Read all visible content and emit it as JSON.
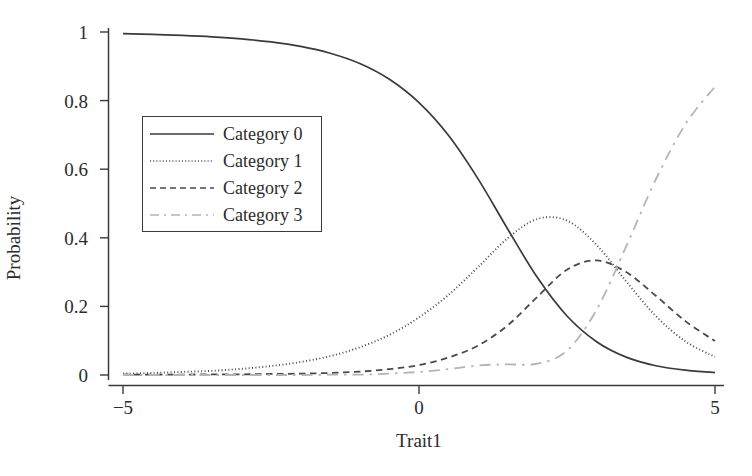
{
  "chart_data": {
    "type": "line",
    "title": "",
    "xlabel": "Trait1",
    "ylabel": "Probability",
    "xlim": [
      -5,
      5
    ],
    "ylim": [
      0,
      1
    ],
    "xticks": [
      "-5",
      "0",
      "5"
    ],
    "xtick_values": [
      -5,
      0,
      5
    ],
    "yticks": [
      "0",
      "0.2",
      "0.4",
      "0.6",
      "0.8",
      "1"
    ],
    "ytick_values": [
      0,
      0.2,
      0.4,
      0.6,
      0.8,
      1
    ],
    "grid": false,
    "legend_position": "upper left",
    "x": [
      -5,
      -4.5,
      -4,
      -3.5,
      -3,
      -2.5,
      -2,
      -1.5,
      -1,
      -0.5,
      0,
      0.5,
      1,
      1.5,
      2,
      2.5,
      3,
      3.5,
      4,
      4.5,
      5
    ],
    "series": [
      {
        "name": "Category 0",
        "style": "solid",
        "color": "#3a3a3a",
        "values": [
          0.995,
          0.993,
          0.99,
          0.986,
          0.98,
          0.971,
          0.958,
          0.938,
          0.908,
          0.862,
          0.794,
          0.698,
          0.571,
          0.425,
          0.284,
          0.172,
          0.097,
          0.052,
          0.027,
          0.014,
          0.007
        ]
      },
      {
        "name": "Category 1",
        "style": "dotted",
        "color": "#4a4a4a",
        "values": [
          0.004,
          0.006,
          0.009,
          0.012,
          0.018,
          0.026,
          0.038,
          0.055,
          0.081,
          0.117,
          0.168,
          0.234,
          0.315,
          0.399,
          0.455,
          0.45,
          0.379,
          0.273,
          0.172,
          0.098,
          0.053
        ]
      },
      {
        "name": "Category 2",
        "style": "dashed",
        "color": "#4a4a4a",
        "values": [
          0.001,
          0.001,
          0.001,
          0.002,
          0.002,
          0.003,
          0.004,
          0.006,
          0.01,
          0.017,
          0.029,
          0.051,
          0.086,
          0.145,
          0.228,
          0.307,
          0.334,
          0.3,
          0.231,
          0.157,
          0.099
        ]
      },
      {
        "name": "Category 3",
        "style": "dashdot",
        "color": "#b4b4b4",
        "values": [
          0.0,
          0.0,
          0.0,
          0.0,
          0.0,
          0.0,
          0.0,
          0.001,
          0.001,
          0.004,
          0.009,
          0.017,
          0.028,
          0.031,
          0.033,
          0.071,
          0.19,
          0.375,
          0.57,
          0.731,
          0.841
        ]
      }
    ]
  },
  "axes": {
    "ylabel": "Probability",
    "xlabel": "Trait1",
    "ytick_labels": [
      "1",
      "0.8",
      "0.6",
      "0.4",
      "0.2",
      "0"
    ],
    "xtick_labels": [
      "−5",
      "0",
      "5"
    ]
  },
  "legend": {
    "entries": [
      {
        "label": "Category 0",
        "style": "solid"
      },
      {
        "label": "Category 1",
        "style": "dotted"
      },
      {
        "label": "Category 2",
        "style": "dashed"
      },
      {
        "label": "Category 3",
        "style": "dashdot"
      }
    ]
  },
  "colors": {
    "axis": "#3a3a3a",
    "cat0": "#3a3a3a",
    "cat1": "#4a4a4a",
    "cat2": "#4a4a4a",
    "cat3": "#b4b4b4",
    "background": "#ffffff"
  }
}
